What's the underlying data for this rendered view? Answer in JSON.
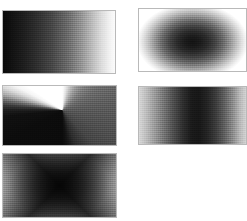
{
  "figure": {
    "background_color": "#ffffff",
    "width": 247,
    "height": 221,
    "panel_border_color": "#b9b9b9",
    "columns": 2,
    "rows": 3,
    "panel_count": 5
  },
  "panels": [
    {
      "id": "linear-horizontal",
      "label": "Linear horizontal ramp",
      "position": "row-1-column-1",
      "gradient_type": "linear",
      "direction": "left-to-right",
      "start_color": "#0a0a0a",
      "end_color": "#fbfbfb",
      "x": 2,
      "y": 10,
      "width": 114,
      "height": 64
    },
    {
      "id": "radial-blob",
      "label": "Radial blob, dark centre",
      "position": "row-1-column-2",
      "gradient_type": "radial",
      "direction": "centre-outward",
      "start_color": "#131313",
      "end_color": "#ffffff",
      "x": 138,
      "y": 8,
      "width": 109,
      "height": 64
    },
    {
      "id": "conic-singularity",
      "label": "Angular gradient with singularity",
      "position": "row-2-column-1",
      "gradient_type": "conic",
      "direction": "about-interior-point",
      "start_color": "#0b0b0b",
      "end_color": "#ffffff",
      "x": 2,
      "y": 85,
      "width": 115,
      "height": 61
    },
    {
      "id": "horizontal-band",
      "label": "Horizontal band, dark centre",
      "position": "row-2-column-2",
      "gradient_type": "linear",
      "direction": "light-edges-dark-centre",
      "start_color": "#d7d7d7",
      "end_color": "#171717",
      "x": 138,
      "y": 86,
      "width": 109,
      "height": 59
    },
    {
      "id": "diamond-core",
      "label": "Diamond core, white corners",
      "position": "row-3-column-1",
      "gradient_type": "diamond",
      "direction": "corners-inward",
      "start_color": "#ffffff",
      "end_color": "#343434",
      "x": 2,
      "y": 153,
      "width": 115,
      "height": 65
    }
  ]
}
